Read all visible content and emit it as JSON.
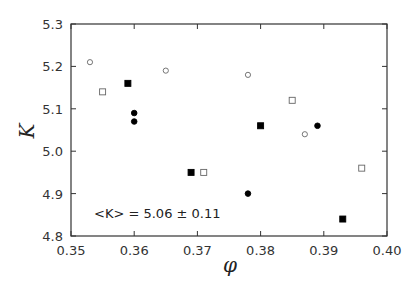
{
  "chart_data": {
    "type": "scatter",
    "title": "",
    "xlabel": "φ",
    "ylabel": "K",
    "xlim": [
      0.35,
      0.4
    ],
    "ylim": [
      4.8,
      5.3
    ],
    "xticks": [
      0.35,
      0.36,
      0.37,
      0.38,
      0.39,
      0.4
    ],
    "xtick_labels": [
      "0.35",
      "0.36",
      "0.37",
      "0.38",
      "0.39",
      "0.40"
    ],
    "yticks": [
      4.8,
      4.9,
      5.0,
      5.1,
      5.2,
      5.3
    ],
    "ytick_labels": [
      "4.8",
      "4.9",
      "5.0",
      "5.1",
      "5.2",
      "5.3"
    ],
    "grid": false,
    "legend": null,
    "annotation": {
      "text": "<K> = 5.06 ± 0.11",
      "x": 0.3537,
      "y": 4.87
    },
    "series": [
      {
        "name": "filled-square",
        "marker": "square",
        "filled": true,
        "points": [
          [
            0.359,
            5.16
          ],
          [
            0.369,
            4.95
          ],
          [
            0.38,
            5.06
          ],
          [
            0.393,
            4.84
          ]
        ]
      },
      {
        "name": "open-square",
        "marker": "square",
        "filled": false,
        "points": [
          [
            0.355,
            5.14
          ],
          [
            0.371,
            4.95
          ],
          [
            0.385,
            5.12
          ],
          [
            0.396,
            4.96
          ]
        ]
      },
      {
        "name": "filled-circle",
        "marker": "circle",
        "filled": true,
        "points": [
          [
            0.36,
            5.09
          ],
          [
            0.36,
            5.07
          ],
          [
            0.378,
            4.9
          ],
          [
            0.389,
            5.06
          ]
        ]
      },
      {
        "name": "open-circle",
        "marker": "circle",
        "filled": false,
        "points": [
          [
            0.353,
            5.21
          ],
          [
            0.365,
            5.19
          ],
          [
            0.378,
            5.18
          ],
          [
            0.387,
            5.04
          ]
        ]
      }
    ],
    "colors": {
      "marker": "#000000",
      "open_marker": "#666666",
      "axis": "#333333"
    }
  }
}
